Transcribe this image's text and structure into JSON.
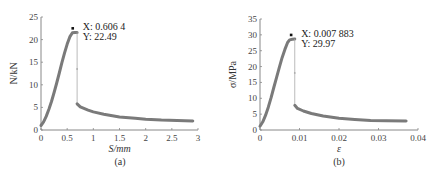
{
  "chart_data": [
    {
      "type": "line",
      "panel_label": "(a)",
      "title": "",
      "xlabel": "S/mm",
      "ylabel": "N/kN",
      "xlim": [
        0,
        3
      ],
      "ylim": [
        0,
        25
      ],
      "xticks": [
        "0",
        "0.5",
        "1",
        "1.5",
        "2",
        "2.5",
        "3"
      ],
      "yticks": [
        "0",
        "5",
        "10",
        "15",
        "20",
        "25"
      ],
      "grid": false,
      "legend": null,
      "annotation": {
        "x_label": "X: 0.606 4",
        "y_label": "Y: 22.49",
        "x": 0.6064,
        "y": 22.49
      },
      "series": [
        {
          "name": "load-displacement",
          "x": [
            0,
            0.05,
            0.1,
            0.15,
            0.2,
            0.25,
            0.3,
            0.35,
            0.4,
            0.45,
            0.5,
            0.55,
            0.6,
            0.6064,
            0.65,
            0.69,
            0.69,
            0.69,
            0.75,
            0.9,
            1.0,
            1.2,
            1.5,
            1.8,
            2.0,
            2.3,
            2.6,
            2.9
          ],
          "y": [
            1.0,
            1.8,
            3.0,
            4.6,
            6.3,
            8.3,
            10.4,
            12.6,
            14.9,
            17.0,
            19.0,
            20.6,
            21.5,
            22.49,
            21.6,
            21.6,
            13.5,
            5.8,
            5.1,
            4.4,
            4.0,
            3.5,
            2.9,
            2.6,
            2.4,
            2.2,
            2.1,
            2.0
          ]
        }
      ]
    },
    {
      "type": "line",
      "panel_label": "(b)",
      "title": "",
      "xlabel": "ε",
      "ylabel": "σ/MPa",
      "xlim": [
        0,
        0.04
      ],
      "ylim": [
        0,
        35
      ],
      "xticks": [
        "0",
        "0.01",
        "0.02",
        "0.03",
        "0.04"
      ],
      "yticks": [
        "0",
        "5",
        "10",
        "15",
        "20",
        "25",
        "30",
        "35"
      ],
      "grid": false,
      "legend": null,
      "annotation": {
        "x_label": "X: 0.007 883",
        "y_label": "Y: 29.97",
        "x": 0.007883,
        "y": 29.97
      },
      "series": [
        {
          "name": "stress-strain",
          "x": [
            0,
            0.0007,
            0.0014,
            0.0021,
            0.0028,
            0.0035,
            0.0042,
            0.0049,
            0.0056,
            0.0063,
            0.007,
            0.0075,
            0.007883,
            0.0082,
            0.0088,
            0.0088,
            0.0088,
            0.0095,
            0.011,
            0.013,
            0.016,
            0.02,
            0.024,
            0.028,
            0.032,
            0.037
          ],
          "y": [
            1.2,
            2.6,
            4.6,
            7.2,
            10.2,
            13.4,
            16.6,
            19.8,
            22.8,
            25.4,
            27.6,
            28.4,
            29.97,
            28.6,
            28.7,
            18.0,
            7.8,
            6.8,
            6.0,
            5.2,
            4.4,
            3.7,
            3.3,
            3.0,
            2.9,
            2.8
          ]
        }
      ]
    }
  ],
  "panels": {
    "a": {
      "caption": "(a)",
      "xlabel": "S/mm",
      "ylabel": "N/kN",
      "ann_x": "X: 0.606 4",
      "ann_y": "Y: 22.49"
    },
    "b": {
      "caption": "(b)",
      "xlabel": "ε",
      "ylabel": "σ/MPa",
      "ann_x": "X: 0.007 883",
      "ann_y": "Y: 29.97"
    }
  },
  "colors": {
    "curve": "#7a7a7a",
    "axis": "#888888",
    "marker": "#111111",
    "drop": "#aaaaaa"
  }
}
